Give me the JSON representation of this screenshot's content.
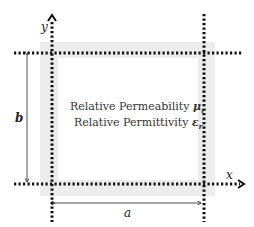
{
  "diagram": {
    "axes": {
      "x_label": "x",
      "y_label": "y"
    },
    "dimensions": {
      "width_label": "a",
      "height_label": "b"
    },
    "properties": [
      {
        "text": "Relative Permeability",
        "symbol": "μ",
        "subscript": "r"
      },
      {
        "text": "Relative Permittivity",
        "symbol": "ε",
        "subscript": "r"
      }
    ],
    "colors": {
      "line": "#111111",
      "shade": "#e8e8e8"
    }
  }
}
